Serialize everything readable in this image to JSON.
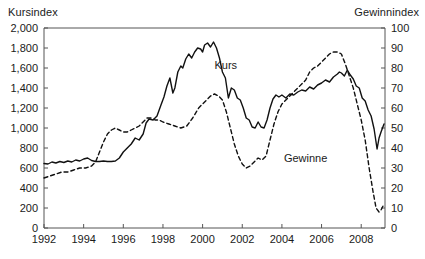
{
  "chart_data": {
    "type": "line",
    "title": "",
    "xlabel": "",
    "ylabel": "Kursindex",
    "y2label": "Gewinnindex",
    "xlim": [
      1992,
      2009.2
    ],
    "ylim": [
      0,
      2000
    ],
    "y2lim": [
      0,
      100
    ],
    "grid": false,
    "legend": "inline-annotations",
    "x_ticks": [
      "1992",
      "1994",
      "1996",
      "1998",
      "2000",
      "2002",
      "2004",
      "2006",
      "2008"
    ],
    "x_tick_values": [
      1992,
      1994,
      1996,
      1998,
      2000,
      2002,
      2004,
      2006,
      2008
    ],
    "y_ticks": [
      "0",
      "200",
      "400",
      "600",
      "800",
      "1,000",
      "1,200",
      "1,400",
      "1,600",
      "1,800",
      "2,000"
    ],
    "y_tick_values": [
      0,
      200,
      400,
      600,
      800,
      1000,
      1200,
      1400,
      1600,
      1800,
      2000
    ],
    "y2_ticks": [
      "0",
      "10",
      "20",
      "30",
      "40",
      "50",
      "60",
      "70",
      "80",
      "90",
      "100"
    ],
    "y2_tick_values": [
      0,
      10,
      20,
      30,
      40,
      50,
      60,
      70,
      80,
      90,
      100
    ],
    "series": [
      {
        "name": "Kurs",
        "axis": "left",
        "style": "solid",
        "color": "#111111",
        "label_x": 2000.6,
        "label_y": 1690,
        "x": [
          1992.0,
          1992.2,
          1992.4,
          1992.6,
          1992.8,
          1993.0,
          1993.2,
          1993.4,
          1993.6,
          1993.8,
          1994.0,
          1994.2,
          1994.4,
          1994.6,
          1994.8,
          1995.0,
          1995.2,
          1995.4,
          1995.6,
          1995.8,
          1996.0,
          1996.2,
          1996.4,
          1996.6,
          1996.8,
          1997.0,
          1997.15,
          1997.3,
          1997.5,
          1997.7,
          1997.9,
          1998.05,
          1998.2,
          1998.35,
          1998.5,
          1998.6,
          1998.75,
          1998.9,
          1999.0,
          1999.15,
          1999.3,
          1999.45,
          1999.6,
          1999.75,
          1999.9,
          2000.0,
          2000.1,
          2000.25,
          2000.4,
          2000.55,
          2000.7,
          2000.85,
          2001.0,
          2001.15,
          2001.3,
          2001.45,
          2001.6,
          2001.75,
          2001.9,
          2002.05,
          2002.2,
          2002.35,
          2002.5,
          2002.65,
          2002.8,
          2002.95,
          2003.1,
          2003.25,
          2003.4,
          2003.55,
          2003.7,
          2003.85,
          2004.0,
          2004.2,
          2004.4,
          2004.6,
          2004.8,
          2005.0,
          2005.2,
          2005.4,
          2005.6,
          2005.8,
          2006.0,
          2006.2,
          2006.4,
          2006.6,
          2006.8,
          2006.9,
          2007.0,
          2007.15,
          2007.3,
          2007.45,
          2007.6,
          2007.75,
          2007.9,
          2008.05,
          2008.2,
          2008.35,
          2008.5,
          2008.65,
          2008.8,
          2008.9,
          2009.0,
          2009.15
        ],
        "y": [
          645,
          640,
          660,
          650,
          665,
          655,
          670,
          660,
          680,
          670,
          690,
          700,
          675,
          665,
          665,
          670,
          665,
          665,
          670,
          700,
          760,
          800,
          840,
          900,
          880,
          940,
          1050,
          1090,
          1080,
          1120,
          1230,
          1310,
          1420,
          1500,
          1350,
          1400,
          1560,
          1620,
          1600,
          1690,
          1740,
          1700,
          1760,
          1800,
          1790,
          1760,
          1830,
          1850,
          1810,
          1860,
          1800,
          1700,
          1560,
          1500,
          1300,
          1400,
          1380,
          1300,
          1280,
          1200,
          1100,
          1080,
          1010,
          1000,
          1060,
          1010,
          1000,
          1080,
          1200,
          1290,
          1330,
          1310,
          1330,
          1300,
          1340,
          1330,
          1360,
          1380,
          1370,
          1410,
          1390,
          1430,
          1450,
          1480,
          1460,
          1510,
          1540,
          1560,
          1550,
          1520,
          1580,
          1530,
          1490,
          1420,
          1400,
          1300,
          1270,
          1180,
          1120,
          990,
          790,
          900,
          960,
          1040
        ]
      },
      {
        "name": "Gewinne",
        "axis": "right",
        "style": "dashed",
        "color": "#111111",
        "label_x": 2004.1,
        "label_y": 38,
        "x": [
          1992.0,
          1992.3,
          1992.6,
          1992.9,
          1993.2,
          1993.5,
          1993.8,
          1994.1,
          1994.4,
          1994.6,
          1994.8,
          1995.0,
          1995.2,
          1995.4,
          1995.6,
          1995.8,
          1996.0,
          1996.2,
          1996.4,
          1996.6,
          1996.8,
          1997.0,
          1997.2,
          1997.4,
          1997.6,
          1997.8,
          1998.0,
          1998.3,
          1998.6,
          1998.9,
          1999.2,
          1999.5,
          1999.8,
          2000.0,
          2000.2,
          2000.4,
          2000.6,
          2000.8,
          2001.0,
          2001.2,
          2001.4,
          2001.6,
          2001.8,
          2002.0,
          2002.2,
          2002.4,
          2002.6,
          2002.8,
          2003.0,
          2003.2,
          2003.4,
          2003.6,
          2003.8,
          2004.0,
          2004.2,
          2004.4,
          2004.6,
          2004.8,
          2005.0,
          2005.2,
          2005.4,
          2005.6,
          2005.8,
          2006.0,
          2006.2,
          2006.4,
          2006.6,
          2006.8,
          2007.0,
          2007.2,
          2007.4,
          2007.6,
          2007.8,
          2008.0,
          2008.2,
          2008.4,
          2008.6,
          2008.75,
          2008.9,
          2009.0,
          2009.15
        ],
        "y": [
          25,
          26,
          27,
          28,
          28,
          29,
          30,
          30,
          31,
          33,
          38,
          43,
          47,
          49,
          50,
          49,
          48,
          48,
          49,
          50,
          51,
          53,
          55,
          55,
          54,
          54,
          53,
          52,
          51,
          50,
          51,
          55,
          60,
          62,
          64,
          66,
          67,
          66,
          64,
          58,
          50,
          42,
          36,
          32,
          30,
          31,
          33,
          35,
          34,
          36,
          44,
          52,
          58,
          62,
          64,
          66,
          68,
          70,
          72,
          74,
          78,
          80,
          81,
          83,
          85,
          87,
          88,
          88,
          87,
          82,
          76,
          70,
          62,
          54,
          44,
          30,
          18,
          10,
          8,
          9,
          12
        ]
      }
    ]
  },
  "axes": {
    "left_title": "Kursindex",
    "right_title": "Gewinnindex"
  }
}
